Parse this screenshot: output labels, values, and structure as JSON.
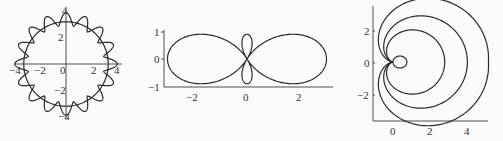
{
  "chart_data": [
    {
      "type": "line",
      "subtype": "polar",
      "title": "",
      "description": "Circle of radius ~3.3 with 16 scalloped petals reaching radius 4",
      "x_ticks": [
        "-4",
        "-2",
        "0",
        "2",
        "4"
      ],
      "y_ticks": [
        "4",
        "2",
        "-2",
        "-4"
      ],
      "xlim": [
        -4,
        4
      ],
      "ylim": [
        -4,
        4
      ],
      "series": [
        {
          "name": "circle",
          "r": 3.3
        },
        {
          "name": "petals",
          "equation": "r = 3.5 + 0.5 cos(16θ)"
        }
      ]
    },
    {
      "type": "line",
      "subtype": "polar",
      "title": "",
      "description": "Figure-eight with small inner vertical loop",
      "x_ticks": [
        "-2",
        "0",
        "2"
      ],
      "y_ticks": [
        "1",
        "0",
        "-1"
      ],
      "xlim": [
        -3.1,
        3.1
      ],
      "ylim": [
        -1,
        1
      ],
      "series": [
        {
          "name": "curve",
          "equation": "r = 1 + 2 cos(2θ)"
        }
      ]
    },
    {
      "type": "line",
      "subtype": "polar",
      "title": "",
      "description": "Nested cardioid-like loops all passing through the origin, with a small inner loop",
      "x_ticks": [
        "0",
        "2",
        "4"
      ],
      "y_ticks": [
        "2",
        "0",
        "-2"
      ],
      "xlim": [
        -1,
        5
      ],
      "ylim": [
        -3.6,
        3.6
      ],
      "series": [
        {
          "name": "inner-loop",
          "equation": "r = 0.8 cos θ"
        },
        {
          "name": "loop-1"
        },
        {
          "name": "loop-2"
        },
        {
          "name": "loop-3"
        }
      ]
    }
  ],
  "plots": {
    "p1": {
      "xt": [
        "−4",
        "−2",
        "0",
        "2",
        "4"
      ],
      "yt": [
        "4",
        "2",
        "−2",
        "−4"
      ]
    },
    "p2": {
      "xt": [
        "−2",
        "0",
        "2"
      ],
      "yt": [
        "1",
        "0",
        "−1"
      ]
    },
    "p3": {
      "xt": [
        "0",
        "2",
        "4"
      ],
      "yt": [
        "2",
        "0",
        "−2"
      ]
    }
  }
}
